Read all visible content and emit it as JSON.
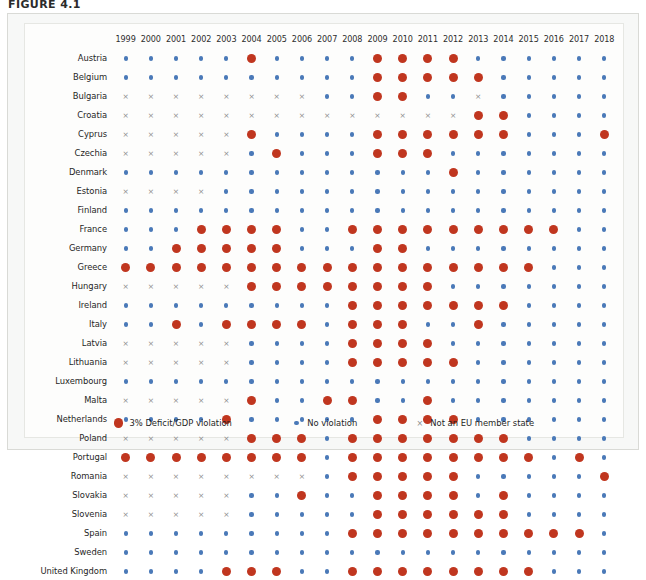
{
  "figure": {
    "title": "FIGURE 4.1"
  },
  "legend": {
    "items": [
      {
        "marker": "violation-dot",
        "label": "3% Deficit/GDP violation"
      },
      {
        "marker": "no-violation-dot",
        "label": "No violation"
      },
      {
        "marker": "not-member-cross",
        "label": "Not an EU member state"
      }
    ]
  },
  "colors": {
    "violation": "#c0361f",
    "no_violation": "#4a79b8",
    "not_member": "#8b8b8b",
    "panel_background": "#f7f8f7",
    "plot_background": "#fdfdfc"
  },
  "markers": {
    "v": "violation",
    "n": "no-violation",
    "x": "not-member"
  },
  "chart_data": {
    "type": "heatmap",
    "title": "FIGURE 4.1",
    "xlabel": "",
    "ylabel": "",
    "grid": false,
    "legend_position": "bottom",
    "value_legend": {
      "v": "3% Deficit/GDP violation",
      "n": "No violation",
      "x": "Not an EU member state"
    },
    "x": [
      1999,
      2000,
      2001,
      2002,
      2003,
      2004,
      2005,
      2006,
      2007,
      2008,
      2009,
      2010,
      2011,
      2012,
      2013,
      2014,
      2015,
      2016,
      2017,
      2018
    ],
    "categories": [
      "1999",
      "2000",
      "2001",
      "2002",
      "2003",
      "2004",
      "2005",
      "2006",
      "2007",
      "2008",
      "2009",
      "2010",
      "2011",
      "2012",
      "2013",
      "2014",
      "2015",
      "2016",
      "2017",
      "2018"
    ],
    "rows": [
      {
        "country": "Austria",
        "values": [
          "n",
          "n",
          "n",
          "n",
          "n",
          "v",
          "n",
          "n",
          "n",
          "n",
          "v",
          "v",
          "v",
          "v",
          "n",
          "n",
          "n",
          "n",
          "n",
          "n"
        ]
      },
      {
        "country": "Belgium",
        "values": [
          "n",
          "n",
          "n",
          "n",
          "n",
          "n",
          "n",
          "n",
          "n",
          "n",
          "v",
          "v",
          "v",
          "v",
          "v",
          "n",
          "n",
          "n",
          "n",
          "n"
        ]
      },
      {
        "country": "Bulgaria",
        "values": [
          "x",
          "x",
          "x",
          "x",
          "x",
          "x",
          "x",
          "x",
          "n",
          "n",
          "v",
          "v",
          "n",
          "n",
          "x",
          "n",
          "n",
          "n",
          "n",
          "n"
        ]
      },
      {
        "country": "Croatia",
        "values": [
          "x",
          "x",
          "x",
          "x",
          "x",
          "x",
          "x",
          "x",
          "x",
          "x",
          "x",
          "x",
          "x",
          "x",
          "v",
          "v",
          "n",
          "n",
          "n",
          "n"
        ]
      },
      {
        "country": "Cyprus",
        "values": [
          "x",
          "x",
          "x",
          "x",
          "x",
          "v",
          "n",
          "n",
          "n",
          "n",
          "v",
          "v",
          "v",
          "v",
          "v",
          "v",
          "n",
          "n",
          "n",
          "v"
        ]
      },
      {
        "country": "Czechia",
        "values": [
          "x",
          "x",
          "x",
          "x",
          "x",
          "n",
          "v",
          "n",
          "n",
          "n",
          "v",
          "v",
          "v",
          "n",
          "n",
          "n",
          "n",
          "n",
          "n",
          "n"
        ]
      },
      {
        "country": "Denmark",
        "values": [
          "n",
          "n",
          "n",
          "n",
          "n",
          "n",
          "n",
          "n",
          "n",
          "n",
          "n",
          "n",
          "n",
          "v",
          "n",
          "n",
          "n",
          "n",
          "n",
          "n"
        ]
      },
      {
        "country": "Estonia",
        "values": [
          "x",
          "x",
          "x",
          "x",
          "n",
          "n",
          "n",
          "n",
          "n",
          "n",
          "n",
          "n",
          "n",
          "n",
          "n",
          "n",
          "n",
          "n",
          "n",
          "n"
        ]
      },
      {
        "country": "Finland",
        "values": [
          "n",
          "n",
          "n",
          "n",
          "n",
          "n",
          "n",
          "n",
          "n",
          "n",
          "n",
          "n",
          "n",
          "n",
          "n",
          "n",
          "n",
          "n",
          "n",
          "n"
        ]
      },
      {
        "country": "France",
        "values": [
          "n",
          "n",
          "n",
          "v",
          "v",
          "v",
          "v",
          "n",
          "n",
          "v",
          "v",
          "v",
          "v",
          "v",
          "v",
          "v",
          "v",
          "v",
          "n",
          "n"
        ]
      },
      {
        "country": "Germany",
        "values": [
          "n",
          "n",
          "v",
          "v",
          "v",
          "v",
          "v",
          "n",
          "n",
          "n",
          "v",
          "v",
          "n",
          "n",
          "n",
          "n",
          "n",
          "n",
          "n",
          "n"
        ]
      },
      {
        "country": "Greece",
        "values": [
          "v",
          "v",
          "v",
          "v",
          "v",
          "v",
          "v",
          "v",
          "v",
          "v",
          "v",
          "v",
          "v",
          "v",
          "v",
          "v",
          "v",
          "n",
          "n",
          "n"
        ]
      },
      {
        "country": "Hungary",
        "values": [
          "x",
          "x",
          "x",
          "x",
          "x",
          "v",
          "v",
          "v",
          "v",
          "v",
          "v",
          "v",
          "v",
          "n",
          "n",
          "n",
          "n",
          "n",
          "n",
          "n"
        ]
      },
      {
        "country": "Ireland",
        "values": [
          "n",
          "n",
          "n",
          "n",
          "n",
          "n",
          "n",
          "n",
          "n",
          "v",
          "v",
          "v",
          "v",
          "v",
          "v",
          "v",
          "n",
          "n",
          "n",
          "n"
        ]
      },
      {
        "country": "Italy",
        "values": [
          "n",
          "n",
          "v",
          "n",
          "v",
          "v",
          "v",
          "v",
          "n",
          "v",
          "v",
          "v",
          "n",
          "n",
          "v",
          "n",
          "n",
          "n",
          "n",
          "n"
        ]
      },
      {
        "country": "Latvia",
        "values": [
          "x",
          "x",
          "x",
          "x",
          "x",
          "n",
          "n",
          "n",
          "n",
          "v",
          "v",
          "v",
          "v",
          "n",
          "n",
          "n",
          "n",
          "n",
          "n",
          "n"
        ]
      },
      {
        "country": "Lithuania",
        "values": [
          "x",
          "x",
          "x",
          "x",
          "x",
          "n",
          "n",
          "n",
          "n",
          "v",
          "v",
          "v",
          "v",
          "v",
          "n",
          "n",
          "n",
          "n",
          "n",
          "n"
        ]
      },
      {
        "country": "Luxembourg",
        "values": [
          "n",
          "n",
          "n",
          "n",
          "n",
          "n",
          "n",
          "n",
          "n",
          "n",
          "n",
          "n",
          "n",
          "n",
          "n",
          "n",
          "n",
          "n",
          "n",
          "n"
        ]
      },
      {
        "country": "Malta",
        "values": [
          "x",
          "x",
          "x",
          "x",
          "x",
          "v",
          "n",
          "n",
          "v",
          "v",
          "n",
          "n",
          "v",
          "n",
          "n",
          "n",
          "n",
          "n",
          "n",
          "n"
        ]
      },
      {
        "country": "Netherlands",
        "values": [
          "n",
          "n",
          "n",
          "n",
          "v",
          "n",
          "n",
          "n",
          "n",
          "n",
          "v",
          "v",
          "v",
          "v",
          "n",
          "n",
          "n",
          "n",
          "n",
          "n"
        ]
      },
      {
        "country": "Poland",
        "values": [
          "x",
          "x",
          "x",
          "x",
          "x",
          "v",
          "v",
          "v",
          "n",
          "v",
          "v",
          "v",
          "v",
          "v",
          "v",
          "v",
          "n",
          "n",
          "n",
          "n"
        ]
      },
      {
        "country": "Portugal",
        "values": [
          "v",
          "v",
          "v",
          "v",
          "v",
          "v",
          "v",
          "v",
          "n",
          "v",
          "v",
          "v",
          "v",
          "v",
          "v",
          "v",
          "v",
          "n",
          "v",
          "n"
        ]
      },
      {
        "country": "Romania",
        "values": [
          "x",
          "x",
          "x",
          "x",
          "x",
          "x",
          "x",
          "x",
          "n",
          "v",
          "v",
          "v",
          "v",
          "v",
          "n",
          "n",
          "n",
          "n",
          "n",
          "v"
        ]
      },
      {
        "country": "Slovakia",
        "values": [
          "x",
          "x",
          "x",
          "x",
          "x",
          "n",
          "n",
          "v",
          "n",
          "n",
          "v",
          "v",
          "v",
          "v",
          "n",
          "v",
          "n",
          "n",
          "n",
          "n"
        ]
      },
      {
        "country": "Slovenia",
        "values": [
          "x",
          "x",
          "x",
          "x",
          "x",
          "n",
          "n",
          "n",
          "n",
          "n",
          "v",
          "v",
          "v",
          "v",
          "v",
          "v",
          "n",
          "n",
          "n",
          "n"
        ]
      },
      {
        "country": "Spain",
        "values": [
          "n",
          "n",
          "n",
          "n",
          "n",
          "n",
          "n",
          "n",
          "n",
          "v",
          "v",
          "v",
          "v",
          "v",
          "v",
          "v",
          "v",
          "v",
          "v",
          "n"
        ]
      },
      {
        "country": "Sweden",
        "values": [
          "n",
          "n",
          "n",
          "n",
          "n",
          "n",
          "n",
          "n",
          "n",
          "n",
          "n",
          "n",
          "n",
          "n",
          "n",
          "n",
          "n",
          "n",
          "n",
          "n"
        ]
      },
      {
        "country": "United Kingdom",
        "values": [
          "n",
          "n",
          "n",
          "n",
          "v",
          "v",
          "v",
          "n",
          "n",
          "v",
          "v",
          "v",
          "v",
          "v",
          "v",
          "v",
          "v",
          "n",
          "n",
          "n"
        ]
      }
    ]
  }
}
